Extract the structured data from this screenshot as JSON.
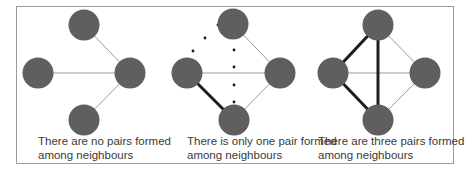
{
  "figure": {
    "colors": {
      "node_fill": "#5f5f5f",
      "thin_edge": "#9a9a9a",
      "thick_edge": "#1e1e1e",
      "dot": "#1a1a1a",
      "frame": "#9a9a9a",
      "text": "#3a3a3a"
    },
    "panels": [
      {
        "id": "panel-1",
        "caption_line1": "There are no pairs formed",
        "caption_line2": "among neighbours",
        "pairs_formed": 0,
        "nodes": [
          {
            "id": "center",
            "x": 130,
            "y": 73
          },
          {
            "id": "top",
            "x": 84,
            "y": 25
          },
          {
            "id": "left",
            "x": 38,
            "y": 73
          },
          {
            "id": "bottom",
            "x": 84,
            "y": 120
          }
        ],
        "thin_edges": [
          [
            "center",
            "top"
          ],
          [
            "center",
            "left"
          ],
          [
            "center",
            "bottom"
          ]
        ],
        "thick_edges": [],
        "dotted_edges": []
      },
      {
        "id": "panel-2",
        "caption_line1": "There is only one pair formed",
        "caption_line2": "among neighbours",
        "pairs_formed": 1,
        "nodes": [
          {
            "id": "center",
            "x": 280,
            "y": 73
          },
          {
            "id": "top",
            "x": 233,
            "y": 24
          },
          {
            "id": "left",
            "x": 187,
            "y": 73
          },
          {
            "id": "bottom",
            "x": 234,
            "y": 120
          }
        ],
        "thin_edges": [
          [
            "center",
            "top"
          ],
          [
            "center",
            "left"
          ],
          [
            "center",
            "bottom"
          ]
        ],
        "thick_edges": [
          [
            "left",
            "bottom"
          ]
        ],
        "dotted_edges": [
          [
            "top",
            "left"
          ],
          [
            "top",
            "bottom"
          ]
        ]
      },
      {
        "id": "panel-3",
        "caption_line1": "There are three pairs formed",
        "caption_line2": "among neighbours",
        "pairs_formed": 3,
        "nodes": [
          {
            "id": "center",
            "x": 425,
            "y": 73
          },
          {
            "id": "top",
            "x": 378,
            "y": 25
          },
          {
            "id": "left",
            "x": 333,
            "y": 73
          },
          {
            "id": "bottom",
            "x": 378,
            "y": 120
          }
        ],
        "thin_edges": [
          [
            "center",
            "top"
          ],
          [
            "center",
            "left"
          ],
          [
            "center",
            "bottom"
          ]
        ],
        "thick_edges": [
          [
            "left",
            "top"
          ],
          [
            "left",
            "bottom"
          ],
          [
            "top",
            "bottom"
          ]
        ],
        "dotted_edges": []
      }
    ]
  }
}
